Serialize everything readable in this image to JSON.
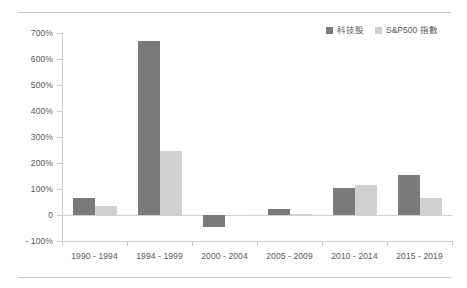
{
  "chart_data": {
    "type": "bar",
    "title": "",
    "subtitle": "",
    "xlabel": "",
    "ylabel": "",
    "categories": [
      "1990 - 1994",
      "1994 - 1999",
      "2000 - 2004",
      "2005 - 2009",
      "2010 - 2014",
      "2015 - 2019"
    ],
    "series": [
      {
        "name": "科技股",
        "color": "#7a7a7a",
        "values": [
          65,
          670,
          -48,
          25,
          105,
          155
        ]
      },
      {
        "name": "S&P500 指數",
        "color": "#d0d0d0",
        "values": [
          35,
          245,
          -3,
          2,
          115,
          65
        ]
      }
    ],
    "ylim": [
      -100,
      700
    ],
    "ytick_step": 100,
    "ytick_labels": [
      "700%",
      "600%",
      "500%",
      "400%",
      "300%",
      "200%",
      "100%",
      "0",
      "- 100%"
    ],
    "ytick_values": [
      700,
      600,
      500,
      400,
      300,
      200,
      100,
      0,
      -100
    ],
    "grid": false,
    "legend_position": "top-right",
    "value_unit": "%"
  },
  "legend": {
    "items": [
      {
        "label": "科技股",
        "swatch": "s0"
      },
      {
        "label": "S&P500 指數",
        "swatch": "s1"
      }
    ]
  },
  "decoration": {
    "rule_color": "#c9c9c9"
  }
}
